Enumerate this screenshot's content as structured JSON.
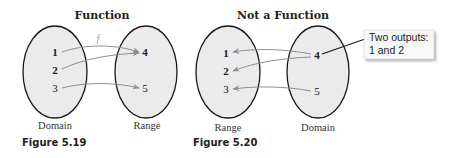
{
  "figures": [
    {
      "title": "Function",
      "caption": "Figure 5.19",
      "left_set_label": "Domain",
      "right_set_label": "Range",
      "mapping_label": "f",
      "left_elements": [
        "1",
        "2",
        "3"
      ],
      "right_elements": [
        "4",
        "5"
      ],
      "mappings": [
        [
          "1",
          "4"
        ],
        [
          "2",
          "4"
        ],
        [
          "3",
          "5"
        ]
      ]
    },
    {
      "title": "Not a Function",
      "caption": "Figure 5.20",
      "left_set_label": "Range",
      "right_set_label": "Domain",
      "left_elements": [
        "1",
        "2",
        "3"
      ],
      "right_elements": [
        "4",
        "5"
      ],
      "mappings": [
        [
          "4",
          "1"
        ],
        [
          "4",
          "2"
        ],
        [
          "5",
          "3"
        ]
      ],
      "callout": {
        "line1": "Two outputs:",
        "line2": "1 and 2"
      }
    }
  ],
  "colors": {
    "oval_fill": "#ebebeb",
    "oval_stroke": "#1a1a1a",
    "arrow": "#8e8e8e"
  }
}
